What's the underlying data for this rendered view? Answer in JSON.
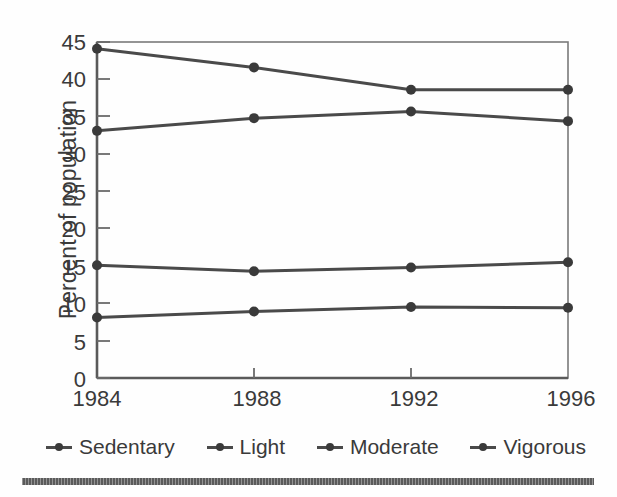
{
  "chart_data": {
    "type": "line",
    "title": "",
    "xlabel": "",
    "ylabel": "Percent of population",
    "categories": [
      "1984",
      "1988",
      "1992",
      "1996"
    ],
    "x": [
      1984,
      1988,
      1992,
      1996
    ],
    "xlim": [
      1984,
      1996
    ],
    "ylim": [
      0,
      45
    ],
    "yticks": [
      0,
      5,
      10,
      15,
      20,
      25,
      30,
      35,
      40,
      45
    ],
    "ytick_labels": [
      "0",
      "5",
      "10",
      "15",
      "20",
      "25",
      "30",
      "35",
      "40",
      "45"
    ],
    "grid": false,
    "legend_position": "bottom",
    "marker": "circle",
    "series": [
      {
        "name": "Sedentary",
        "values": [
          44.1,
          41.6,
          38.6,
          38.6
        ],
        "color": "#4a4a4a"
      },
      {
        "name": "Light",
        "values": [
          33.1,
          34.8,
          35.7,
          34.4
        ],
        "color": "#4a4a4a"
      },
      {
        "name": "Moderate",
        "values": [
          15.1,
          14.3,
          14.8,
          15.5
        ],
        "color": "#4a4a4a"
      },
      {
        "name": "Vigorous",
        "values": [
          8.1,
          8.9,
          9.5,
          9.4
        ],
        "color": "#4a4a4a"
      }
    ]
  },
  "axes": {
    "y_title": "Percent of population",
    "y_tick_labels": [
      "45",
      "40",
      "35",
      "30",
      "25",
      "20",
      "15",
      "10",
      "5",
      "0"
    ],
    "x_tick_labels": [
      "1984",
      "1988",
      "1992",
      "1996"
    ]
  },
  "legend": {
    "items": [
      {
        "label": "Sedentary"
      },
      {
        "label": "Light"
      },
      {
        "label": "Moderate"
      },
      {
        "label": "Vigorous"
      }
    ]
  },
  "colors": {
    "line": "#4a4a4a",
    "marker": "#3a3a3a",
    "axis": "#6a6a6a",
    "text": "#3a3a3a",
    "rule": "#5a5a5a",
    "background": "#fefefe"
  }
}
